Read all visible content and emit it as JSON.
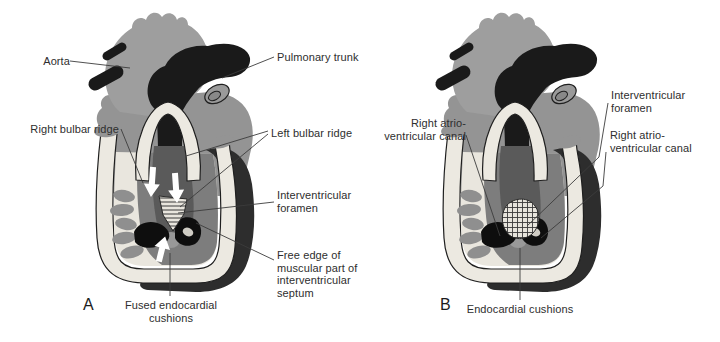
{
  "figure": {
    "type": "embryonic-heart-septation-diagram",
    "panel_a": {
      "letter": "A",
      "labels": {
        "aorta": "Aorta",
        "pulmonary_trunk": "Pulmonary trunk",
        "right_bulbar_ridge": "Right bulbar ridge",
        "left_bulbar_ridge": "Left bulbar ridge",
        "interventricular_foramen": "Interventricular foramen",
        "free_edge": "Free edge of muscular part of interventricular septum",
        "fused_endocardial_cushions": "Fused endocardial cushions"
      }
    },
    "panel_b": {
      "letter": "B",
      "labels": {
        "right_atrioventricular_canal_left": "Right atrio-ventricular canal",
        "interventricular_foramen": "Interventricular foramen",
        "right_atrioventricular_canal_right": "Right atrio-ventricular canal",
        "endocardial_cushions": "Endocardial cushions"
      }
    },
    "colors": {
      "background": "#ffffff",
      "aorta_gray": "#9e9e9e",
      "body_gray": "#949494",
      "trunk_black": "#1a1a1a",
      "wall_cream": "#ece9e1",
      "crescent_dark": "#2d2d2d",
      "lumen_light": "#e9e6de",
      "interior_gray": "#7d7d7d",
      "septum_gray": "#5a5a5a",
      "cushion_black": "#0e0e0e",
      "scallop_gray": "#8f8f8f",
      "outline": "#1f1f1f",
      "leader_line": "#3c3c3c",
      "arrow_white": "#ffffff",
      "label_text": "#2e2e2e"
    }
  }
}
